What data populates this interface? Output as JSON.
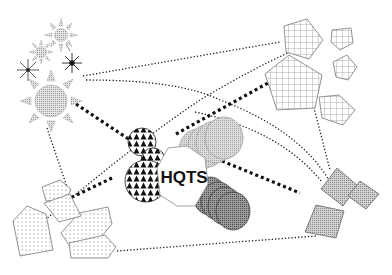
{
  "diagram": {
    "hub": {
      "label": "HQTS"
    },
    "clusters": [
      {
        "id": "suns",
        "shape": "sun-icon",
        "count": 5,
        "position": "top-left",
        "pattern": "stipple"
      },
      {
        "id": "pentagons",
        "shape": "pentagon",
        "count": 5,
        "position": "top-right",
        "pattern": "grid"
      },
      {
        "id": "polygons",
        "shape": "irregular-polygon",
        "count": 5,
        "position": "bottom-left",
        "pattern": "dots"
      },
      {
        "id": "squares",
        "shape": "rotated-square",
        "count": 3,
        "position": "bottom-right",
        "pattern": "fine-hatch"
      }
    ],
    "hub_satellites": [
      {
        "id": "triangle-blob",
        "pattern": "triangles",
        "position": "left-of-hub"
      },
      {
        "id": "light-circles",
        "pattern": "light-stipple",
        "count": 4,
        "position": "upper-right-of-hub"
      },
      {
        "id": "dark-circles",
        "pattern": "dark-stipple",
        "count": 4,
        "position": "lower-right-of-hub"
      }
    ],
    "colors": {
      "stroke": "#777777",
      "dotted_line": "#111111",
      "sun_fill": "#cfcfcf",
      "square_fill": "#bdbdbd",
      "light_circle_fill": "#c8c8c8",
      "dark_circle_fill": "#8a8a8a",
      "background": "#ffffff"
    }
  }
}
